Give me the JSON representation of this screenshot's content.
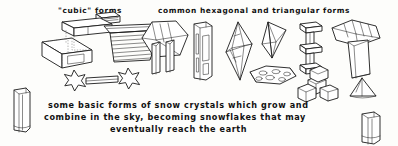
{
  "illustration": {
    "medium": "pen-and-ink line drawing",
    "background_color": "#fdfdfb",
    "ink_color": "#1a1a1a"
  },
  "labels": {
    "cubic_title": "\"cubic\" forms",
    "hex_title": "common hexagonal and triangular forms"
  },
  "caption": {
    "line1": "some basic forms of snow crystals which grow and",
    "line2": "combine in the sky, becoming snowflakes that may",
    "line3": "eventually reach the earth"
  },
  "figures": [
    {
      "id": "stacked-blocks",
      "group": "cubic",
      "name": "stacked rectangular blocks"
    },
    {
      "id": "stepped-bowl",
      "group": "cubic",
      "name": "stepped layered bowl"
    },
    {
      "id": "star-pair-column",
      "group": "cubic",
      "name": "two six-pointed stars joined by a column"
    },
    {
      "id": "hex-plate-columns",
      "group": "hexagonal",
      "name": "hexagonal plate with two columns"
    },
    {
      "id": "hex-column-tall",
      "group": "hexagonal",
      "name": "tall hexagonal column"
    },
    {
      "id": "hex-bipyramid",
      "group": "hexagonal",
      "name": "hexagonal bipyramid"
    },
    {
      "id": "triangular-pyramid",
      "group": "triangular",
      "name": "triangular pyramid"
    },
    {
      "id": "capped-column-stack",
      "group": "hexagonal",
      "name": "capped column stack"
    },
    {
      "id": "hex-cup",
      "group": "hexagonal",
      "name": "flared hexagonal cup"
    },
    {
      "id": "spotted-hex-plate",
      "group": "hexagonal",
      "name": "hexagonal plate with hollow spots"
    },
    {
      "id": "crystal-cluster",
      "group": "hexagonal",
      "name": "cluster of short hexagonal prisms"
    },
    {
      "id": "small-pyramid",
      "group": "triangular",
      "name": "small triangular pyramid"
    },
    {
      "id": "column-left",
      "group": "hexagonal",
      "name": "hexagonal column at lower left"
    },
    {
      "id": "column-right",
      "group": "hexagonal",
      "name": "hexagonal column at lower right"
    }
  ]
}
